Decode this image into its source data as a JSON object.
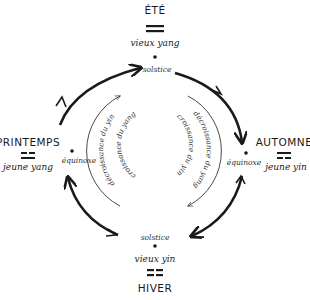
{
  "diagram": {
    "type": "seasonal-cycle",
    "direction": "clockwise",
    "nodes": {
      "top": {
        "season": "ÉTÉ",
        "trigram": "yang-yang",
        "label": "vieux yang",
        "point": "solstice"
      },
      "right": {
        "season": "AUTOMNE",
        "trigram": "yang-yin",
        "label": "jeune yin",
        "point": "équinoxe"
      },
      "bottom": {
        "season": "HIVER",
        "trigram": "yin-yin",
        "label": "vieux yin",
        "point": "solstice"
      },
      "left": {
        "season": "PRINTEMPS",
        "trigram": "yin-yang",
        "label": "jeune yang",
        "point": "équinoxe"
      }
    },
    "inner": {
      "left_outer": "décroissance du yin",
      "left_inner": "croissance du yang",
      "right_outer": "décroissance du yang",
      "right_inner": "croissance du yin"
    },
    "colors": {
      "ink": "#1a1a1a",
      "background": "#ffffff"
    }
  }
}
